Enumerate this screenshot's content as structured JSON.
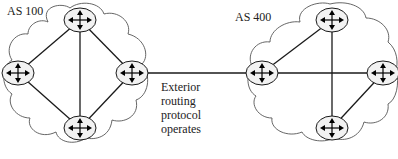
{
  "diagram": {
    "colors": {
      "line": "#1a1a1a",
      "cloud": "#555555",
      "router_fill": "#f2f2f2",
      "text": "#222222"
    },
    "autonomous_systems": [
      {
        "label": "AS 100",
        "routers": [
          {
            "id": "r100_top",
            "x": 80,
            "y": 20
          },
          {
            "id": "r100_left",
            "x": 18,
            "y": 73
          },
          {
            "id": "r100_right",
            "x": 132,
            "y": 73
          },
          {
            "id": "r100_bottom",
            "x": 80,
            "y": 128
          }
        ]
      },
      {
        "label": "AS 400",
        "routers": [
          {
            "id": "r400_left",
            "x": 262,
            "y": 73
          },
          {
            "id": "r400_top",
            "x": 332,
            "y": 20
          },
          {
            "id": "r400_right",
            "x": 383,
            "y": 73
          },
          {
            "id": "r400_bottom",
            "x": 332,
            "y": 128
          }
        ]
      }
    ],
    "links": [
      [
        "r100_top",
        "r100_left"
      ],
      [
        "r100_top",
        "r100_right"
      ],
      [
        "r100_top",
        "r100_bottom"
      ],
      [
        "r100_left",
        "r100_bottom"
      ],
      [
        "r100_right",
        "r100_bottom"
      ],
      [
        "r400_left",
        "r400_top"
      ],
      [
        "r400_left",
        "r400_right"
      ],
      [
        "r400_top",
        "r400_bottom"
      ],
      [
        "r400_right",
        "r400_bottom"
      ],
      [
        "r100_right",
        "r400_left"
      ]
    ],
    "annotation": {
      "lines": [
        "Exterior",
        "routing",
        "protocol",
        "operates"
      ]
    }
  }
}
